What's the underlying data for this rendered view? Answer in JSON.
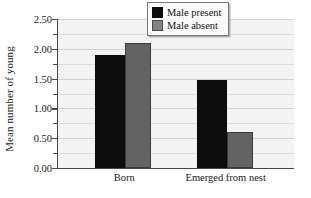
{
  "chart_data": {
    "type": "bar",
    "title": "",
    "xlabel": "",
    "ylabel": "Mean number of young",
    "categories": [
      "Born",
      "Emerged from nest"
    ],
    "series": [
      {
        "name": "Male present",
        "color": "#0d0d0d",
        "values": [
          1.9,
          1.48
        ]
      },
      {
        "name": "Male absent",
        "color": "#636363",
        "values": [
          2.1,
          0.6
        ]
      }
    ],
    "ylim": [
      0.0,
      2.5
    ],
    "ytick_labels": [
      "0.00",
      "0.50",
      "1.00",
      "1.50",
      "2.00",
      "2.50"
    ],
    "ytick_values": [
      0.0,
      0.5,
      1.0,
      1.5,
      2.0,
      2.5
    ],
    "yminor_step": 0.25,
    "grid": true,
    "grid_axis": "y",
    "legend_position": "top-right",
    "plot_background": "#f3f3f3",
    "axis_color": "#4a4a4a",
    "gridline_color": "#dcdcdc"
  },
  "legend": {
    "entries": [
      {
        "label": "Male present",
        "swatch": "present"
      },
      {
        "label": "Male absent",
        "swatch": "absent"
      }
    ]
  }
}
